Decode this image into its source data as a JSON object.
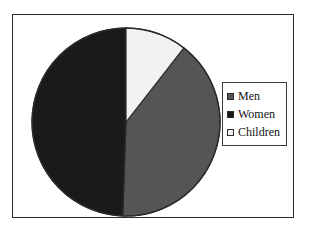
{
  "chart_data": {
    "type": "pie",
    "title": "",
    "subtitle": "",
    "xlabel": "",
    "ylabel": "",
    "grid": false,
    "legend_position": "right",
    "start_angle_deg": 0,
    "direction": "clockwise",
    "categories": [
      "Men",
      "Women",
      "Children"
    ],
    "values": [
      40,
      49,
      11
    ],
    "value_unit": "percent",
    "slices": [
      {
        "label": "Men",
        "value": 40,
        "percent": "40%",
        "color": "#555555",
        "start_angle_deg": 38,
        "end_angle_deg": 182
      },
      {
        "label": "Women",
        "value": 49,
        "percent": "49%",
        "color": "#1a1a1a",
        "start_angle_deg": 182,
        "end_angle_deg": 360
      },
      {
        "label": "Children",
        "value": 11,
        "percent": "11%",
        "color": "#f2f2f2",
        "start_angle_deg": 0,
        "end_angle_deg": 38
      }
    ],
    "colors": {
      "men": "#555555",
      "women": "#1a1a1a",
      "children": "#f2f2f2",
      "outline": "#2b2b2b",
      "frame": "#2b2b2b",
      "background": "#ffffff"
    }
  },
  "legend": {
    "items": [
      {
        "label": "Men",
        "swatch_color": "#555555"
      },
      {
        "label": "Women",
        "swatch_color": "#1a1a1a"
      },
      {
        "label": "Children",
        "swatch_color": "#f2f2f2"
      }
    ]
  }
}
